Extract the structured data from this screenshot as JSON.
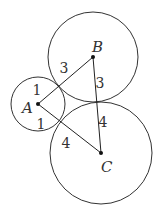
{
  "diagram": {
    "circles": [
      {
        "id": "A",
        "cx": 38,
        "cy": 104,
        "r": 27
      },
      {
        "id": "B",
        "cx": 93,
        "cy": 57,
        "r": 45
      },
      {
        "id": "C",
        "cx": 101,
        "cy": 153,
        "r": 51
      }
    ],
    "points": [
      {
        "id": "A",
        "label": "A",
        "x": 38,
        "y": 104,
        "lx": 22,
        "ly": 113
      },
      {
        "id": "B",
        "label": "B",
        "x": 93,
        "y": 57,
        "lx": 92,
        "ly": 52
      },
      {
        "id": "C",
        "label": "C",
        "x": 101,
        "y": 153,
        "lx": 101,
        "ly": 172
      }
    ],
    "segments": [
      {
        "from": "A",
        "to": "B"
      },
      {
        "from": "B",
        "to": "C"
      },
      {
        "from": "A",
        "to": "C"
      }
    ],
    "length_labels": [
      {
        "text": "1",
        "x": 37,
        "y": 95,
        "note": "radius of A toward B"
      },
      {
        "text": "3",
        "x": 64,
        "y": 73,
        "note": "radius of B toward A"
      },
      {
        "text": "3",
        "x": 100,
        "y": 88,
        "note": "radius of B toward C"
      },
      {
        "text": "1",
        "x": 41,
        "y": 129,
        "note": "radius of A toward C"
      },
      {
        "text": "4",
        "x": 103,
        "y": 127,
        "note": "radius of C toward B"
      },
      {
        "text": "4",
        "x": 66,
        "y": 148,
        "note": "radius of C toward A"
      }
    ]
  }
}
